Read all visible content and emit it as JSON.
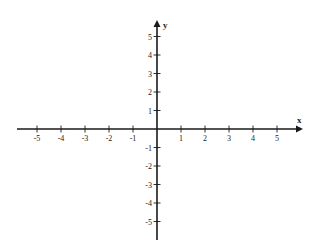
{
  "diagram": {
    "type": "cartesian-coordinate-plane",
    "colors": {
      "axis": "#1a1a1a",
      "background": "#ffffff",
      "text": "#222222"
    },
    "x_axis": {
      "label": "x",
      "ticks": [
        -5,
        -4,
        -3,
        -2,
        -1,
        1,
        2,
        3,
        4,
        5
      ],
      "tick_labels": [
        "-5",
        "-4",
        "-3",
        "-2",
        "-1",
        "1",
        "2",
        "3",
        "4",
        "5"
      ],
      "range": [
        -6,
        6
      ]
    },
    "y_axis": {
      "label": "y",
      "ticks": [
        5,
        4,
        3,
        2,
        1,
        -1,
        -2,
        -3,
        -4,
        -5
      ],
      "tick_labels": [
        "5",
        "4",
        "3",
        "2",
        "1",
        "-1",
        "-2",
        "-3",
        "-4",
        "-5"
      ],
      "range": [
        -6,
        6
      ]
    },
    "layout": {
      "origin_px": [
        157,
        129
      ],
      "x_unit_px": 24,
      "y_unit_px": 18.5,
      "x_line": [
        17,
        303
      ],
      "y_line": [
        20,
        240
      ]
    }
  }
}
